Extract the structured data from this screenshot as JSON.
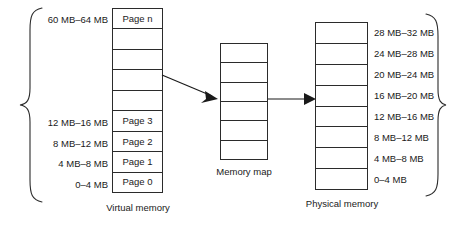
{
  "diagram": {
    "line_color": "#2b2b2b",
    "background": "#ffffff"
  },
  "virtual_memory": {
    "caption": "Virtual memory",
    "cells": [
      {
        "text": "Page n",
        "range": "60 MB–64 MB"
      },
      {
        "text": "",
        "range": ""
      },
      {
        "text": "",
        "range": ""
      },
      {
        "text": "",
        "range": ""
      },
      {
        "text": "",
        "range": ""
      },
      {
        "text": "Page 3",
        "range": "12 MB–16 MB"
      },
      {
        "text": "Page 2",
        "range": "8 MB–12 MB"
      },
      {
        "text": "Page 1",
        "range": "4 MB–8 MB"
      },
      {
        "text": "Page 0",
        "range": "0–4 MB"
      }
    ]
  },
  "memory_map": {
    "caption": "Memory map",
    "cells": [
      {
        "text": ""
      },
      {
        "text": ""
      },
      {
        "text": ""
      },
      {
        "text": ""
      },
      {
        "text": ""
      },
      {
        "text": ""
      }
    ]
  },
  "physical_memory": {
    "caption": "Physical memory",
    "cells": [
      {
        "text": "",
        "range": "28 MB–32 MB"
      },
      {
        "text": "",
        "range": "24 MB–28 MB"
      },
      {
        "text": "",
        "range": "20 MB–24 MB"
      },
      {
        "text": "",
        "range": "16 MB–20 MB"
      },
      {
        "text": "",
        "range": "12 MB–16 MB"
      },
      {
        "text": "",
        "range": "8 MB–12 MB"
      },
      {
        "text": "",
        "range": "4 MB–8 MB"
      },
      {
        "text": "",
        "range": "0–4 MB"
      }
    ]
  },
  "connectors": {
    "virtual_to_map": "arrow",
    "map_to_physical": "arrow"
  },
  "braces": {
    "left": "curly-brace-right-facing",
    "right": "curly-brace-left-facing"
  }
}
